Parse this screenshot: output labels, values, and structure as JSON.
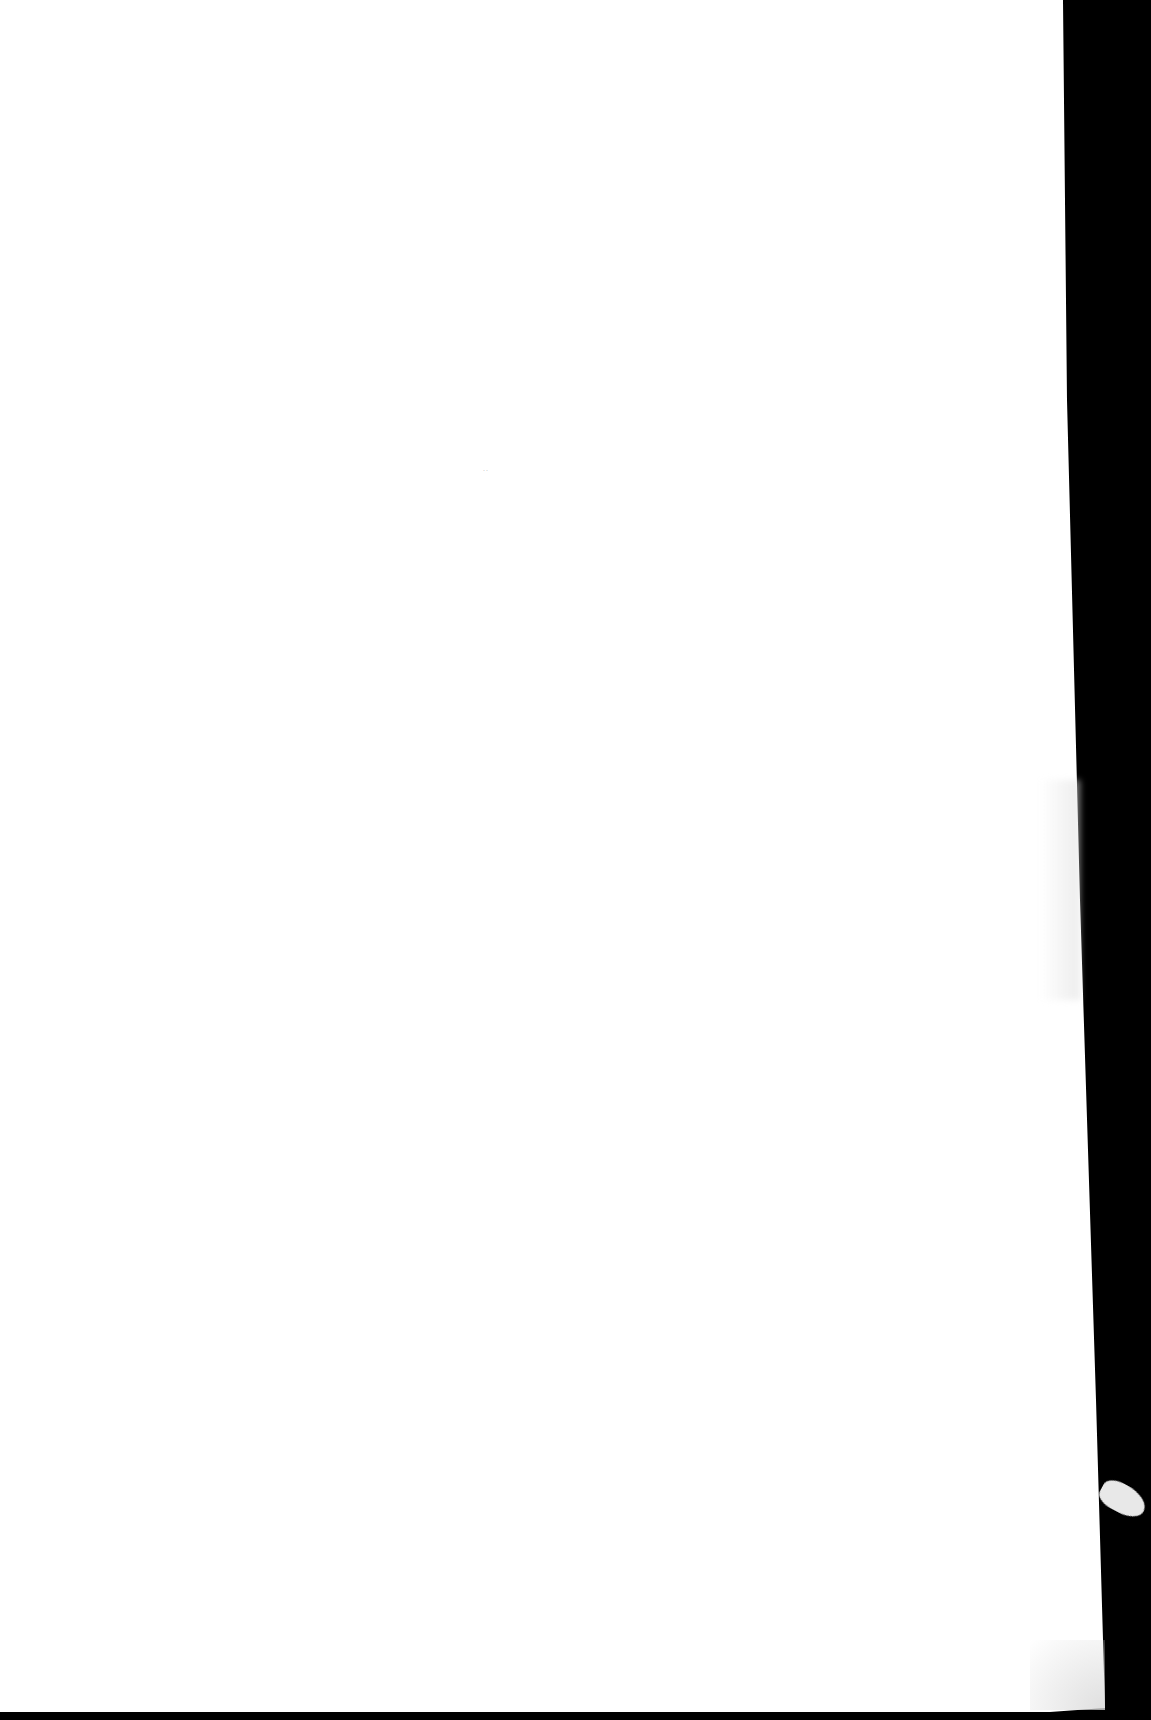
{
  "document": {
    "type": "scanned-page",
    "content": "",
    "speck_mark": "··"
  },
  "colors": {
    "page": "#ffffff",
    "scan_background": "#000000",
    "fragment": "#e8e8e8"
  }
}
